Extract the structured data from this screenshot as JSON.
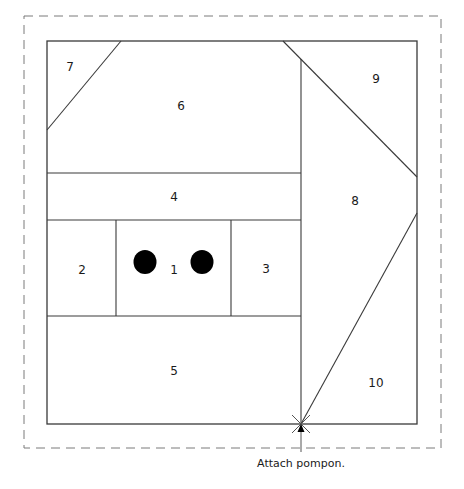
{
  "diagram": {
    "title": "",
    "caption": "Attach pompon.",
    "colors": {
      "line": "#3a3a3a",
      "dashed": "#7a7a7a",
      "dot": "#000000",
      "background": "#ffffff"
    },
    "seam_allowance_border": {
      "x1": 24,
      "y1": 16,
      "x2": 441,
      "y2": 448,
      "style": "dashed"
    },
    "block_frame": {
      "x1": 47,
      "y1": 41,
      "x2": 417,
      "y2": 424
    },
    "pieces": [
      {
        "id": "1",
        "label": "1",
        "label_pos": [
          174,
          270
        ]
      },
      {
        "id": "2",
        "label": "2",
        "label_pos": [
          82,
          270
        ]
      },
      {
        "id": "3",
        "label": "3",
        "label_pos": [
          266,
          269
        ]
      },
      {
        "id": "4",
        "label": "4",
        "label_pos": [
          174,
          197
        ]
      },
      {
        "id": "5",
        "label": "5",
        "label_pos": [
          174,
          371
        ]
      },
      {
        "id": "6",
        "label": "6",
        "label_pos": [
          181,
          106
        ]
      },
      {
        "id": "7",
        "label": "7",
        "label_pos": [
          70,
          67
        ]
      },
      {
        "id": "8",
        "label": "8",
        "label_pos": [
          355,
          201
        ]
      },
      {
        "id": "9",
        "label": "9",
        "label_pos": [
          376,
          79
        ]
      },
      {
        "id": "10",
        "label": "10",
        "label_pos": [
          376,
          383
        ]
      }
    ],
    "eyes": [
      {
        "name": "left-eye",
        "cx": 145,
        "cy": 262,
        "r": 11
      },
      {
        "name": "right-eye",
        "cx": 202,
        "cy": 262,
        "r": 11
      }
    ],
    "pompon_marker": {
      "x": 301,
      "y": 424
    },
    "caption_pos": [
      301,
      457
    ]
  }
}
